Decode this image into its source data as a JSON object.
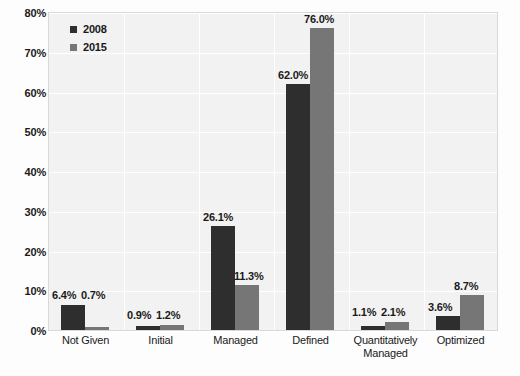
{
  "chart_data": {
    "type": "bar",
    "title": "",
    "subtitle": "",
    "xlabel": "",
    "ylabel": "",
    "ylim": [
      0,
      80
    ],
    "ytick_values": [
      0,
      10,
      20,
      30,
      40,
      50,
      60,
      70,
      80
    ],
    "ytick_labels": [
      "0%",
      "10%",
      "20%",
      "30%",
      "40%",
      "50%",
      "60%",
      "70%",
      "80%"
    ],
    "grid": true,
    "legend_position": "top-left-inside",
    "categories": [
      "Not Given",
      "Initial",
      "Managed",
      "Defined",
      "Quantitatively Managed",
      "Optimized"
    ],
    "category_lines": [
      [
        "Not Given"
      ],
      [
        "Initial"
      ],
      [
        "Managed"
      ],
      [
        "Defined"
      ],
      [
        "Quantitatively",
        "Managed"
      ],
      [
        "Optimized"
      ]
    ],
    "series": [
      {
        "name": "2008",
        "color": "#2e2e2e",
        "values": [
          6.4,
          0.9,
          26.1,
          62.0,
          1.1,
          3.6
        ],
        "labels": [
          "6.4%",
          "0.9%",
          "26.1%",
          "62.0%",
          "1.1%",
          "3.6%"
        ]
      },
      {
        "name": "2015",
        "color": "#767676",
        "values": [
          0.7,
          1.2,
          11.3,
          76.0,
          2.1,
          8.7
        ],
        "labels": [
          "0.7%",
          "1.2%",
          "11.3%",
          "76.0%",
          "2.1%",
          "8.7%"
        ]
      }
    ]
  },
  "legend": {
    "items": [
      {
        "label": "2008",
        "color": "#2e2e2e"
      },
      {
        "label": "2015",
        "color": "#767676"
      }
    ]
  },
  "style": {
    "plot_background": "#f2f2f2",
    "grid_color": "#ffffff",
    "page_background": "#fdfdfd",
    "text_color": "#1a1a1a"
  }
}
